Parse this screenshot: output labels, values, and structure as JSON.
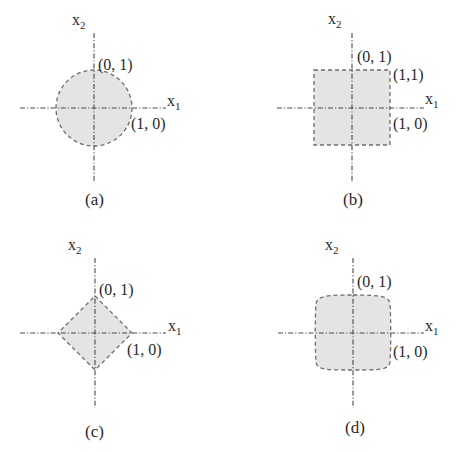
{
  "figure": {
    "fill_color": "#e4e4e4",
    "outline_color": "#6e6e6e",
    "axis_color": "#4a4a4a",
    "panels": [
      {
        "id": "a",
        "caption": "(a)",
        "shape": "circle",
        "axis_x_label": "x",
        "axis_x_sub": "1",
        "axis_y_label": "x",
        "axis_y_sub": "2",
        "point_labels": [
          "(0, 1)",
          "(1, 0)"
        ]
      },
      {
        "id": "b",
        "caption": "(b)",
        "shape": "square",
        "axis_x_label": "x",
        "axis_x_sub": "1",
        "axis_y_label": "x",
        "axis_y_sub": "2",
        "point_labels": [
          "(0, 1)",
          "(1, 0)",
          "(1,1)"
        ]
      },
      {
        "id": "c",
        "caption": "(c)",
        "shape": "diamond",
        "axis_x_label": "x",
        "axis_x_sub": "1",
        "axis_y_label": "x",
        "axis_y_sub": "2",
        "point_labels": [
          "(0, 1)",
          "(1, 0)"
        ]
      },
      {
        "id": "d",
        "caption": "(d)",
        "shape": "superellipse",
        "axis_x_label": "x",
        "axis_x_sub": "1",
        "axis_y_label": "x",
        "axis_y_sub": "2",
        "point_labels": [
          "(0, 1)",
          "(1, 0)"
        ]
      }
    ]
  }
}
